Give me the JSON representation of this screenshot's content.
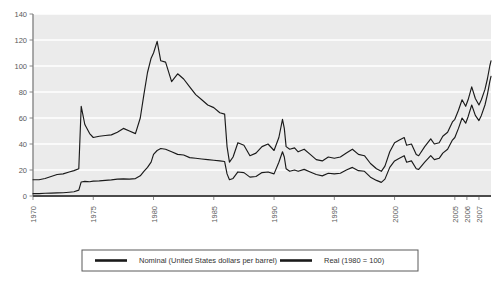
{
  "chart_data": {
    "type": "line",
    "title": "",
    "subtitle": "",
    "xlabel": "",
    "ylabel": "",
    "xlim": [
      1970,
      2008
    ],
    "ylim": [
      0,
      140
    ],
    "yticks": [
      0,
      20,
      40,
      60,
      80,
      100,
      120,
      140
    ],
    "xticks": [
      1970,
      1975,
      1980,
      1985,
      1990,
      1995,
      2000,
      2005,
      2006,
      2007
    ],
    "xtick_labels": [
      "1970",
      "1975",
      "1980",
      "1985",
      "1990",
      "1995",
      "2000",
      "2005",
      "2006",
      "2007"
    ],
    "ytick_labels": [
      "0",
      "20",
      "40",
      "60",
      "80",
      "100",
      "120",
      "140"
    ],
    "grid": true,
    "grid_axis": "y",
    "legend_position": "bottom",
    "plot_bgcolor": "#ebebeb",
    "gridline_color": "#ffffff",
    "line_color": "#1a1a1a",
    "series": [
      {
        "name": "Nominal (United States dollars per barrel)",
        "x": [
          1970.0,
          1970.5,
          1971.0,
          1971.5,
          1972.0,
          1972.5,
          1973.0,
          1973.4,
          1973.8,
          1974.0,
          1974.3,
          1974.7,
          1975.0,
          1975.5,
          1976.0,
          1976.5,
          1977.0,
          1977.5,
          1978.0,
          1978.5,
          1978.9,
          1979.2,
          1979.5,
          1979.8,
          1980.0,
          1980.3,
          1980.6,
          1981.0,
          1981.5,
          1982.0,
          1982.5,
          1983.0,
          1983.5,
          1984.0,
          1984.5,
          1985.0,
          1985.5,
          1985.9,
          1986.1,
          1986.3,
          1986.6,
          1987.0,
          1987.5,
          1988.0,
          1988.5,
          1989.0,
          1989.5,
          1990.0,
          1990.4,
          1990.7,
          1990.85,
          1991.0,
          1991.3,
          1991.7,
          1992.0,
          1992.5,
          1993.0,
          1993.5,
          1994.0,
          1994.5,
          1995.0,
          1995.5,
          1996.0,
          1996.5,
          1997.0,
          1997.5,
          1998.0,
          1998.5,
          1998.9,
          1999.2,
          1999.6,
          2000.0,
          2000.4,
          2000.8,
          2001.0,
          2001.4,
          2001.8,
          2002.0,
          2002.5,
          2003.0,
          2003.3,
          2003.7,
          2004.0,
          2004.4,
          2004.8,
          2005.0,
          2005.3,
          2005.6,
          2005.9,
          2006.1,
          2006.4,
          2006.7,
          2007.0,
          2007.2,
          2007.5,
          2007.7,
          2007.9,
          2008.0
        ],
        "values": [
          1.8,
          1.8,
          2.1,
          2.2,
          2.4,
          2.5,
          2.9,
          3.3,
          4.5,
          10.8,
          11.2,
          11.0,
          11.4,
          11.6,
          12.0,
          12.4,
          13.0,
          13.2,
          13.0,
          13.4,
          15.5,
          19.0,
          22.0,
          26.0,
          32.0,
          35.0,
          36.5,
          36.0,
          34.0,
          32.0,
          31.5,
          29.5,
          29.0,
          28.5,
          28.0,
          27.5,
          27.0,
          26.5,
          17.0,
          12.5,
          13.5,
          18.5,
          18.0,
          14.5,
          15.0,
          18.0,
          18.5,
          17.0,
          26.0,
          34.0,
          30.0,
          21.0,
          19.0,
          20.0,
          19.0,
          20.5,
          18.5,
          16.5,
          15.5,
          17.5,
          17.0,
          17.5,
          20.0,
          22.0,
          19.5,
          19.0,
          14.5,
          12.0,
          10.5,
          13.0,
          22.0,
          27.0,
          29.0,
          31.0,
          26.0,
          27.0,
          21.0,
          20.5,
          26.0,
          31.0,
          28.0,
          29.0,
          33.0,
          36.0,
          43.0,
          45.0,
          52.0,
          60.0,
          56.0,
          61.0,
          70.0,
          62.0,
          58.0,
          62.0,
          70.0,
          78.0,
          88.0,
          92.0
        ]
      },
      {
        "name": "Real (1980 = 100)",
        "x": [
          1970.0,
          1970.5,
          1971.0,
          1971.5,
          1972.0,
          1972.5,
          1973.0,
          1973.4,
          1973.8,
          1974.0,
          1974.3,
          1974.7,
          1975.0,
          1975.5,
          1976.0,
          1976.5,
          1977.0,
          1977.5,
          1978.0,
          1978.5,
          1978.9,
          1979.2,
          1979.5,
          1979.8,
          1980.0,
          1980.3,
          1980.6,
          1981.0,
          1981.5,
          1982.0,
          1982.5,
          1983.0,
          1983.5,
          1984.0,
          1984.5,
          1985.0,
          1985.5,
          1985.9,
          1986.1,
          1986.3,
          1986.6,
          1987.0,
          1987.5,
          1988.0,
          1988.5,
          1989.0,
          1989.5,
          1990.0,
          1990.4,
          1990.7,
          1990.85,
          1991.0,
          1991.3,
          1991.7,
          1992.0,
          1992.5,
          1993.0,
          1993.5,
          1994.0,
          1994.5,
          1995.0,
          1995.5,
          1996.0,
          1996.5,
          1997.0,
          1997.5,
          1998.0,
          1998.5,
          1998.9,
          1999.2,
          1999.6,
          2000.0,
          2000.4,
          2000.8,
          2001.0,
          2001.4,
          2001.8,
          2002.0,
          2002.5,
          2003.0,
          2003.3,
          2003.7,
          2004.0,
          2004.4,
          2004.8,
          2005.0,
          2005.3,
          2005.6,
          2005.9,
          2006.1,
          2006.4,
          2006.7,
          2007.0,
          2007.2,
          2007.5,
          2007.7,
          2007.9,
          2008.0
        ],
        "values": [
          12.5,
          12.5,
          13.5,
          15.0,
          16.5,
          17.0,
          18.5,
          19.5,
          21.0,
          69.0,
          55.0,
          48.0,
          45.0,
          46.0,
          46.5,
          47.0,
          49.0,
          52.0,
          50.0,
          48.0,
          60.0,
          78.0,
          95.0,
          106.0,
          110.0,
          119.0,
          104.0,
          103.0,
          88.0,
          94.0,
          90.0,
          84.0,
          78.0,
          74.0,
          70.0,
          68.0,
          64.0,
          63.0,
          38.0,
          26.0,
          30.0,
          41.0,
          39.0,
          31.0,
          33.0,
          38.0,
          40.0,
          35.0,
          45.0,
          59.0,
          52.0,
          38.0,
          36.0,
          37.0,
          34.0,
          36.0,
          32.0,
          28.0,
          27.0,
          30.0,
          29.0,
          30.0,
          33.0,
          36.0,
          32.0,
          31.0,
          25.0,
          21.0,
          19.0,
          23.0,
          34.0,
          41.0,
          43.0,
          45.0,
          39.0,
          40.0,
          32.0,
          31.0,
          38.0,
          44.0,
          40.0,
          41.0,
          46.0,
          49.0,
          57.0,
          59.0,
          66.0,
          74.0,
          69.0,
          74.0,
          84.0,
          75.0,
          70.0,
          74.0,
          82.0,
          90.0,
          100.0,
          104.0
        ]
      }
    ]
  },
  "legend": {
    "items": [
      {
        "label": "Nominal (United States dollars per barrel)"
      },
      {
        "label": "Real (1980 = 100)"
      }
    ]
  }
}
